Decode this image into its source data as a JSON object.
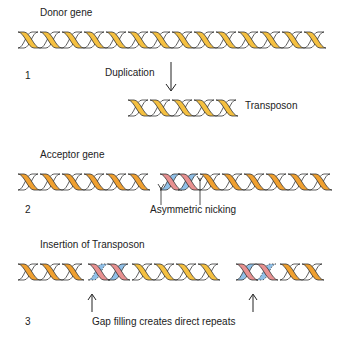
{
  "panels": [
    {
      "number": "1",
      "title": "Donor gene",
      "action_label": "Duplication",
      "product_label": "Transposon"
    },
    {
      "number": "2",
      "title": "Acceptor gene",
      "annotation": "Asymmetric nicking"
    },
    {
      "number": "3",
      "title": "Insertion of Transposon",
      "annotation": "Gap filling creates direct repeats"
    }
  ],
  "colors": {
    "donor_strand": "#f5c040",
    "acceptor_strand": "#f0a030",
    "complement_strand": "#ffffff",
    "target_site_pink": "#e89090",
    "target_site_blue": "#90c0e8",
    "outline": "#333333"
  }
}
